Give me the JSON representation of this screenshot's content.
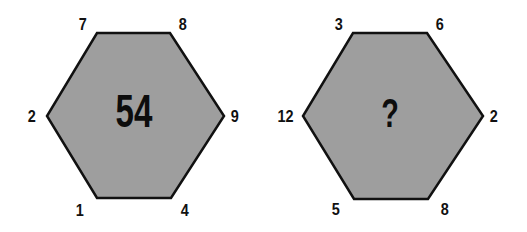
{
  "puzzle": {
    "fill_color": "#9e9e9e",
    "stroke_color": "#111111",
    "hexagons": [
      {
        "center": "54",
        "vertices": {
          "top_left": "7",
          "top_right": "8",
          "right": "9",
          "bottom_right": "4",
          "bottom_left": "1",
          "left": "2"
        }
      },
      {
        "center": "?",
        "vertices": {
          "top_left": "3",
          "top_right": "6",
          "right": "2",
          "bottom_right": "8",
          "bottom_left": "5",
          "left": "12"
        }
      }
    ]
  }
}
